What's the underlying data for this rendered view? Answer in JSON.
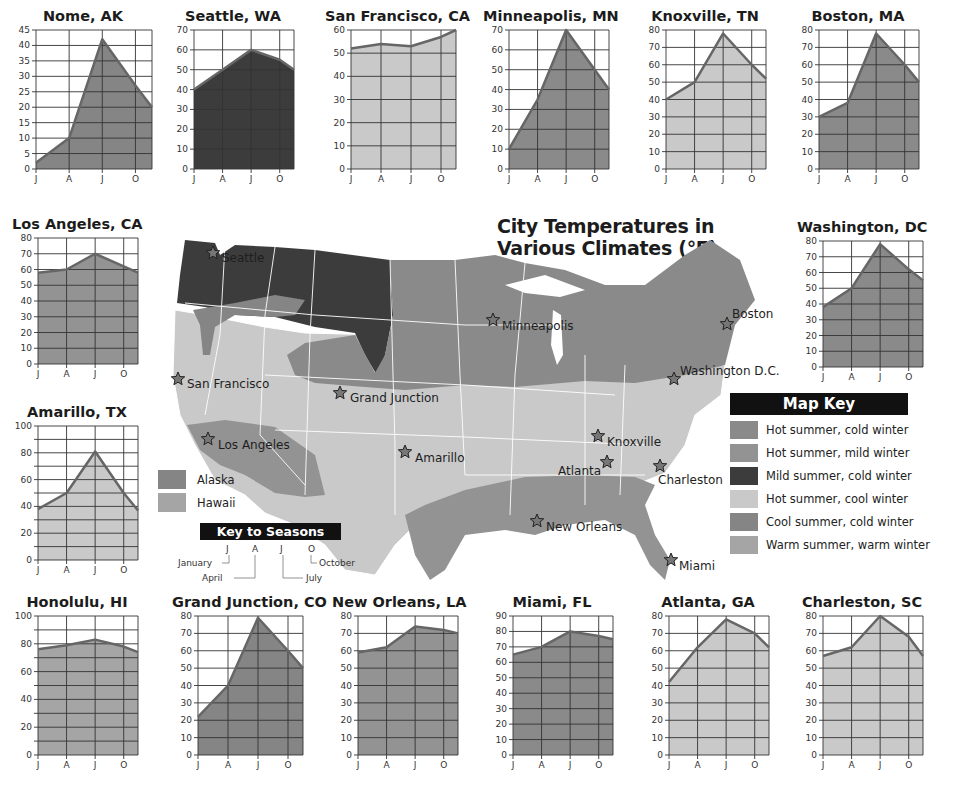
{
  "title": {
    "line1": "City Temperatures in",
    "line2": "Various Climates (°F)"
  },
  "colors": {
    "hot_summer_cold_winter": "#8a8a8a",
    "hot_summer_mild_winter": "#939393",
    "mild_summer_cold_winter": "#3c3c3c",
    "hot_summer_cool_winter": "#c9c9c9",
    "cool_summer_cold_winter": "#858585",
    "warm_summer_warm_winter": "#a5a5a5",
    "line": "#666666",
    "grid": "#333333"
  },
  "map_key": {
    "header": "Map Key",
    "items": [
      {
        "label": "Hot summer, cold winter",
        "color": "#8a8a8a"
      },
      {
        "label": "Hot summer, mild winter",
        "color": "#939393"
      },
      {
        "label": "Mild summer, cold winter",
        "color": "#3c3c3c"
      },
      {
        "label": "Hot summer, cool winter",
        "color": "#c9c9c9"
      },
      {
        "label": "Cool summer, cold winter",
        "color": "#858585"
      },
      {
        "label": "Warm summer, warm winter",
        "color": "#a5a5a5"
      }
    ]
  },
  "inset_key": {
    "items": [
      {
        "label": "Alaska",
        "color": "#858585"
      },
      {
        "label": "Hawaii",
        "color": "#a5a5a5"
      }
    ]
  },
  "key_to_seasons": {
    "header": "Key to Seasons",
    "letters": [
      "J",
      "A",
      "J",
      "O"
    ],
    "names": [
      "January",
      "April",
      "July",
      "October"
    ]
  },
  "map_cities": [
    {
      "name": "Seattle",
      "x": 48,
      "y": 38,
      "lx": 57,
      "ly": 47,
      "light": true
    },
    {
      "name": "San Francisco",
      "x": 13,
      "y": 164,
      "lx": 22,
      "ly": 173
    },
    {
      "name": "Los Angeles",
      "x": 43,
      "y": 224,
      "lx": 53,
      "ly": 234
    },
    {
      "name": "Grand Junction",
      "x": 175,
      "y": 178,
      "lx": 185,
      "ly": 187
    },
    {
      "name": "Amarillo",
      "x": 240,
      "y": 237,
      "lx": 250,
      "ly": 247
    },
    {
      "name": "Minneapolis",
      "x": 328,
      "y": 105,
      "lx": 337,
      "ly": 115
    },
    {
      "name": "Knoxville",
      "x": 433,
      "y": 221,
      "lx": 442,
      "ly": 231
    },
    {
      "name": "Atlanta",
      "x": 442,
      "y": 247,
      "lx": 393,
      "ly": 260
    },
    {
      "name": "Charleston",
      "x": 495,
      "y": 251,
      "lx": 493,
      "ly": 269
    },
    {
      "name": "New Orleans",
      "x": 372,
      "y": 306,
      "lx": 381,
      "ly": 316
    },
    {
      "name": "Miami",
      "x": 506,
      "y": 345,
      "lx": 514,
      "ly": 355
    },
    {
      "name": "Washington D.C.",
      "x": 509,
      "y": 164,
      "lx": 515,
      "ly": 160
    },
    {
      "name": "Boston",
      "x": 562,
      "y": 109,
      "lx": 567,
      "ly": 103
    }
  ],
  "chart_data": [
    {
      "type": "area",
      "title": "Nome, AK",
      "categories": [
        "J",
        "A",
        "J",
        "O"
      ],
      "values": [
        2,
        10,
        42,
        27,
        20
      ],
      "yticks": [
        0,
        5,
        10,
        15,
        20,
        25,
        30,
        35,
        40,
        45
      ],
      "ylim": [
        0,
        45
      ],
      "fill": "#858585",
      "pos": {
        "x": 10,
        "y": 8,
        "w": 146,
        "h": 175
      }
    },
    {
      "type": "area",
      "title": "Seattle, WA",
      "categories": [
        "J",
        "A",
        "J",
        "O"
      ],
      "values": [
        40,
        50,
        60,
        55,
        50
      ],
      "yticks": [
        0,
        10,
        20,
        30,
        40,
        50,
        60,
        70
      ],
      "ylim": [
        0,
        70
      ],
      "fill": "#3c3c3c",
      "pos": {
        "x": 168,
        "y": 8,
        "w": 130,
        "h": 175
      }
    },
    {
      "type": "area",
      "title": "San Francisco, CA",
      "categories": [
        "J",
        "A",
        "J",
        "O"
      ],
      "values": [
        52,
        54,
        53,
        57,
        60
      ],
      "yticks": [
        0,
        10,
        20,
        30,
        40,
        50,
        60
      ],
      "ylim": [
        0,
        60
      ],
      "fill": "#c9c9c9",
      "pos": {
        "x": 325,
        "y": 8,
        "w": 135,
        "h": 175
      }
    },
    {
      "type": "area",
      "title": "Minneapolis, MN",
      "categories": [
        "J",
        "A",
        "J",
        "O"
      ],
      "values": [
        10,
        35,
        70,
        50,
        40
      ],
      "yticks": [
        0,
        10,
        20,
        30,
        40,
        50,
        60,
        70
      ],
      "ylim": [
        0,
        70
      ],
      "fill": "#8a8a8a",
      "pos": {
        "x": 483,
        "y": 8,
        "w": 130,
        "h": 175
      }
    },
    {
      "type": "area",
      "title": "Knoxville, TN",
      "categories": [
        "J",
        "A",
        "J",
        "O"
      ],
      "values": [
        40,
        50,
        78,
        60,
        52
      ],
      "yticks": [
        0,
        10,
        20,
        30,
        40,
        50,
        60,
        70,
        80
      ],
      "ylim": [
        0,
        80
      ],
      "fill": "#c9c9c9",
      "pos": {
        "x": 640,
        "y": 8,
        "w": 130,
        "h": 175
      }
    },
    {
      "type": "area",
      "title": "Boston, MA",
      "categories": [
        "J",
        "A",
        "J",
        "O"
      ],
      "values": [
        30,
        38,
        78,
        60,
        50
      ],
      "yticks": [
        0,
        10,
        20,
        30,
        40,
        50,
        60,
        70,
        80
      ],
      "ylim": [
        0,
        80
      ],
      "fill": "#8a8a8a",
      "pos": {
        "x": 793,
        "y": 8,
        "w": 130,
        "h": 175
      }
    },
    {
      "type": "area",
      "title": "Los Angeles, CA",
      "categories": [
        "J",
        "A",
        "J",
        "O"
      ],
      "values": [
        58,
        60,
        70,
        62,
        58
      ],
      "yticks": [
        0,
        10,
        20,
        30,
        40,
        50,
        60,
        70,
        80
      ],
      "ylim": [
        0,
        80
      ],
      "fill": "#939393",
      "pos": {
        "x": 12,
        "y": 216,
        "w": 130,
        "h": 162
      }
    },
    {
      "type": "area",
      "title": "Washington, DC",
      "categories": [
        "J",
        "A",
        "J",
        "O"
      ],
      "values": [
        38,
        50,
        78,
        62,
        55
      ],
      "yticks": [
        0,
        10,
        20,
        30,
        40,
        50,
        60,
        70,
        80
      ],
      "ylim": [
        0,
        80
      ],
      "fill": "#8a8a8a",
      "pos": {
        "x": 797,
        "y": 219,
        "w": 130,
        "h": 162
      }
    },
    {
      "type": "area",
      "title": "Amarillo, TX",
      "categories": [
        "J",
        "A",
        "J",
        "O"
      ],
      "values": [
        38,
        50,
        81,
        50,
        37
      ],
      "yticks": [
        0,
        20,
        40,
        60,
        80,
        100
      ],
      "ylim": [
        0,
        100
      ],
      "fill": "#c9c9c9",
      "pos": {
        "x": 12,
        "y": 404,
        "w": 130,
        "h": 170
      }
    },
    {
      "type": "area",
      "title": "Honolulu, HI",
      "categories": [
        "J",
        "A",
        "J",
        "O"
      ],
      "values": [
        76,
        79,
        83,
        78,
        74
      ],
      "yticks": [
        0,
        20,
        40,
        60,
        80,
        100
      ],
      "ylim": [
        0,
        100
      ],
      "fill": "#a5a5a5",
      "pos": {
        "x": 12,
        "y": 594,
        "w": 130,
        "h": 175
      }
    },
    {
      "type": "area",
      "title": "Grand Junction, CO",
      "categories": [
        "J",
        "A",
        "J",
        "O"
      ],
      "values": [
        22,
        40,
        79,
        60,
        50
      ],
      "yticks": [
        0,
        10,
        20,
        30,
        40,
        50,
        60,
        70,
        80
      ],
      "ylim": [
        0,
        80
      ],
      "fill": "#858585",
      "pos": {
        "x": 172,
        "y": 594,
        "w": 135,
        "h": 175
      }
    },
    {
      "type": "area",
      "title": "New Orleans, LA",
      "categories": [
        "J",
        "A",
        "J",
        "O"
      ],
      "values": [
        59,
        62,
        74,
        72,
        70
      ],
      "yticks": [
        0,
        10,
        20,
        30,
        40,
        50,
        60,
        70,
        80
      ],
      "ylim": [
        0,
        80
      ],
      "fill": "#939393",
      "pos": {
        "x": 332,
        "y": 594,
        "w": 130,
        "h": 175
      }
    },
    {
      "type": "area",
      "title": "Miami, FL",
      "categories": [
        "J",
        "A",
        "J",
        "O"
      ],
      "values": [
        65,
        70,
        80,
        77,
        75
      ],
      "yticks": [
        0,
        10,
        20,
        30,
        40,
        50,
        60,
        70,
        80,
        90
      ],
      "ylim": [
        0,
        90
      ],
      "fill": "#8a8a8a",
      "pos": {
        "x": 487,
        "y": 594,
        "w": 130,
        "h": 175
      }
    },
    {
      "type": "area",
      "title": "Atlanta, GA",
      "categories": [
        "J",
        "A",
        "J",
        "O"
      ],
      "values": [
        42,
        62,
        78,
        70,
        62
      ],
      "yticks": [
        0,
        10,
        20,
        30,
        40,
        50,
        60,
        70,
        80
      ],
      "ylim": [
        0,
        80
      ],
      "fill": "#c9c9c9",
      "pos": {
        "x": 643,
        "y": 594,
        "w": 130,
        "h": 175
      }
    },
    {
      "type": "area",
      "title": "Charleston, SC",
      "categories": [
        "J",
        "A",
        "J",
        "O"
      ],
      "values": [
        57,
        62,
        80,
        68,
        57
      ],
      "yticks": [
        0,
        10,
        20,
        30,
        40,
        50,
        60,
        70,
        80
      ],
      "ylim": [
        0,
        80
      ],
      "fill": "#c9c9c9",
      "pos": {
        "x": 797,
        "y": 594,
        "w": 130,
        "h": 175
      }
    }
  ]
}
